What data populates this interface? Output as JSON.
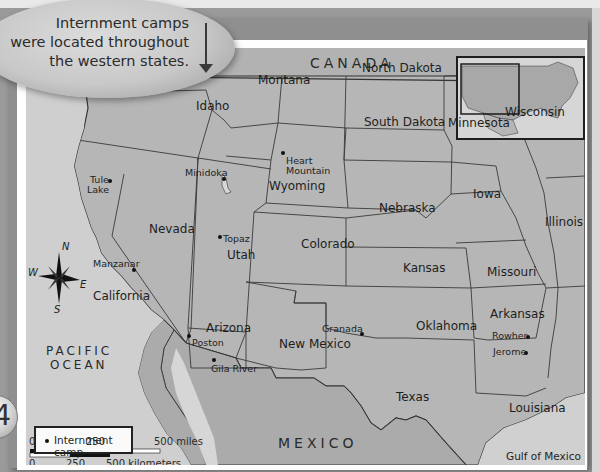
{
  "callout": {
    "lines": [
      "Internment camps",
      "were located throughout",
      "the western states."
    ],
    "arrow_icon": "down-arrow"
  },
  "page_badge": {
    "number": "4"
  },
  "map": {
    "countries": [
      {
        "name": "CANADA"
      },
      {
        "name": "MEXICO"
      }
    ],
    "water_bodies": [
      {
        "name_line1": "PACIFIC",
        "name_line2": "OCEAN"
      },
      {
        "name": "Gulf of Mexico"
      }
    ],
    "states": [
      {
        "name": "Montana"
      },
      {
        "name": "North Dakota"
      },
      {
        "name": "Oregon"
      },
      {
        "name": "Idaho"
      },
      {
        "name": "South Dakota"
      },
      {
        "name": "Minnesota"
      },
      {
        "name": "Wisconsin"
      },
      {
        "name": "Wyoming"
      },
      {
        "name": "Iowa"
      },
      {
        "name": "Nebraska"
      },
      {
        "name": "Illinois"
      },
      {
        "name": "Nevada"
      },
      {
        "name": "Utah"
      },
      {
        "name": "Colorado"
      },
      {
        "name": "Kansas"
      },
      {
        "name": "Missouri"
      },
      {
        "name": "California"
      },
      {
        "name": "Arizona"
      },
      {
        "name": "New Mexico"
      },
      {
        "name": "Oklahoma"
      },
      {
        "name": "Arkansas"
      },
      {
        "name": "Texas"
      },
      {
        "name": "Louisiana"
      }
    ],
    "camps": [
      {
        "name_line1": "Tule",
        "name_line2": "Lake"
      },
      {
        "name": "Minidoka"
      },
      {
        "name_line1": "Heart",
        "name_line2": "Mountain"
      },
      {
        "name": "Topaz"
      },
      {
        "name": "Manzanar"
      },
      {
        "name": "Granada"
      },
      {
        "name": "Poston"
      },
      {
        "name": "Gila River"
      },
      {
        "name": "Rowher"
      },
      {
        "name": "Jerome"
      }
    ],
    "compass": {
      "n": "N",
      "s": "S",
      "e": "E",
      "w": "W"
    },
    "legend": {
      "items": [
        {
          "symbol": "dot",
          "label": "Internment camp"
        }
      ]
    },
    "scale": {
      "miles": {
        "ticks": [
          "0",
          "250",
          "500 miles"
        ]
      },
      "kilometers": {
        "ticks": [
          "0",
          "250",
          "500 kilometers"
        ]
      }
    },
    "colors": {
      "land": "#b4b4b4",
      "water": "#d2d2d2",
      "border": "#3a3a3a",
      "frame": "#9a9a9a"
    }
  }
}
